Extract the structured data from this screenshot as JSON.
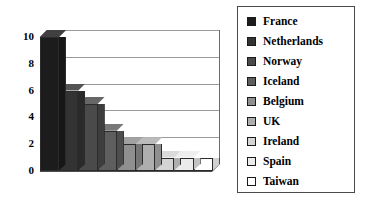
{
  "chart_data": {
    "type": "bar",
    "title": "",
    "xlabel": "",
    "ylabel": "",
    "ylim": [
      0,
      10
    ],
    "yticks": [
      "0",
      "2",
      "4",
      "6",
      "8",
      "10"
    ],
    "grid": true,
    "legend_position": "right",
    "style": "3d-column",
    "categories": [
      "France",
      "Netherlands",
      "Norway",
      "Iceland",
      "Belgium",
      "UK",
      "Ireland",
      "Spain",
      "Taiwan"
    ],
    "values": [
      10,
      6,
      5,
      3,
      2,
      2,
      1,
      1,
      1
    ],
    "colors": [
      "#1c1c1c",
      "#333333",
      "#4a4a4a",
      "#5e5e5e",
      "#8f8f8f",
      "#aeaeae",
      "#d4d4d4",
      "#ebebeb",
      "#ffffff"
    ]
  },
  "legend": {
    "items": [
      {
        "label": "France",
        "color": "#1c1c1c"
      },
      {
        "label": "Netherlands",
        "color": "#333333"
      },
      {
        "label": "Norway",
        "color": "#4a4a4a"
      },
      {
        "label": "Iceland",
        "color": "#5e5e5e"
      },
      {
        "label": "Belgium",
        "color": "#8f8f8f"
      },
      {
        "label": "UK",
        "color": "#aeaeae"
      },
      {
        "label": "Ireland",
        "color": "#d4d4d4"
      },
      {
        "label": "Spain",
        "color": "#ebebeb"
      },
      {
        "label": "Taiwan",
        "color": "#ffffff"
      }
    ]
  }
}
